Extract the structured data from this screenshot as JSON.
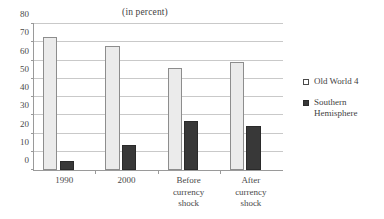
{
  "chart_data": {
    "type": "bar",
    "title": "(in percent)",
    "subtitle": "",
    "xlabel": "",
    "ylabel": "",
    "ylim": [
      0,
      80
    ],
    "ytick_step": 10,
    "yticks": [
      0,
      10,
      20,
      30,
      40,
      50,
      60,
      70,
      80
    ],
    "grid": true,
    "legend_position": "right",
    "categories": [
      "1990",
      "2000",
      "Before currency shock",
      "After currency shock"
    ],
    "category_lines": [
      [
        "1990"
      ],
      [
        "2000"
      ],
      [
        "Before",
        "currency",
        "shock"
      ],
      [
        "After",
        "currency",
        "shock"
      ]
    ],
    "series": [
      {
        "name": "Old World 4",
        "color": "#ebebeb",
        "border": "#8d8d8d",
        "values": [
          73,
          68,
          56,
          59
        ]
      },
      {
        "name": "Southern Hemisphere",
        "color": "#383838",
        "border": "#2a2a2a",
        "values": [
          5,
          13.5,
          27,
          24
        ]
      }
    ]
  },
  "legend": {
    "items": [
      {
        "label": "Old World 4",
        "lines": [
          "Old World 4"
        ],
        "swatch": "light"
      },
      {
        "label": "Southern Hemisphere",
        "lines": [
          "Southern",
          "Hemisphere"
        ],
        "swatch": "dark"
      }
    ]
  },
  "colors": {
    "axis": "#9a9a9a",
    "grid": "#c9c9c9",
    "text": "#3f3f3f",
    "series_light": "#ebebeb",
    "series_dark": "#383838"
  }
}
